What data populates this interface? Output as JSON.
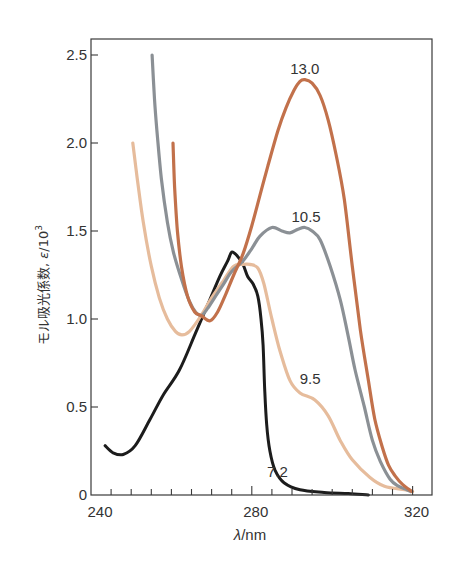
{
  "chart_data": {
    "type": "line",
    "title": "",
    "xlabel": "λ/nm",
    "ylabel": "モル吸光係数, ε/10³",
    "ylabel_parts": {
      "main": "モル吸光係数, ",
      "eps": "ε",
      "slash": "/10",
      "sup": "3"
    },
    "xlim": [
      240,
      325
    ],
    "ylim": [
      0,
      2.59
    ],
    "x_ticks": [
      240,
      280,
      320
    ],
    "x_tick_labels": [
      "240",
      "280",
      "320"
    ],
    "x_minor_step": 5,
    "y_ticks": [
      0,
      0.5,
      1.0,
      1.5,
      2.0,
      2.5
    ],
    "y_tick_labels": [
      "0",
      "0.5",
      "1.0",
      "1.5",
      "2.0",
      "2.5"
    ],
    "grid": false,
    "legend": "inline labels",
    "series": [
      {
        "name": "7.2",
        "color": "#1c1c1c",
        "label_pos": [
          286.4,
          0.13
        ],
        "points": [
          [
            243.5,
            0.28
          ],
          [
            245.5,
            0.24
          ],
          [
            248,
            0.23
          ],
          [
            251,
            0.28
          ],
          [
            254.7,
            0.43
          ],
          [
            258,
            0.57
          ],
          [
            262,
            0.71
          ],
          [
            266,
            0.92
          ],
          [
            269,
            1.08
          ],
          [
            272,
            1.24
          ],
          [
            274,
            1.33
          ],
          [
            275,
            1.38
          ],
          [
            276.3,
            1.36
          ],
          [
            277.8,
            1.31
          ],
          [
            279,
            1.24
          ],
          [
            280.3,
            1.2
          ],
          [
            281.5,
            1.13
          ],
          [
            282.3,
            1.0
          ],
          [
            282.8,
            0.85
          ],
          [
            283.2,
            0.6
          ],
          [
            283.7,
            0.4
          ],
          [
            284.5,
            0.25
          ],
          [
            285.8,
            0.14
          ],
          [
            288,
            0.07
          ],
          [
            292,
            0.03
          ],
          [
            298,
            0.015
          ],
          [
            304,
            0.008
          ],
          [
            309,
            0.0
          ]
        ]
      },
      {
        "name": "9.5",
        "color": "#e6bc9c",
        "label_pos": [
          294.5,
          0.66
        ],
        "points": [
          [
            250.4,
            2.0
          ],
          [
            251.5,
            1.8
          ],
          [
            253,
            1.55
          ],
          [
            255,
            1.3
          ],
          [
            257,
            1.12
          ],
          [
            259,
            1.0
          ],
          [
            261,
            0.93
          ],
          [
            262.6,
            0.91
          ],
          [
            264.5,
            0.93
          ],
          [
            267.4,
            1.02
          ],
          [
            270,
            1.12
          ],
          [
            273,
            1.22
          ],
          [
            275.5,
            1.3
          ],
          [
            277.8,
            1.31
          ],
          [
            279.5,
            1.31
          ],
          [
            281.5,
            1.29
          ],
          [
            283,
            1.2
          ],
          [
            285,
            1.0
          ],
          [
            287,
            0.82
          ],
          [
            289.5,
            0.65
          ],
          [
            292,
            0.58
          ],
          [
            295.7,
            0.54
          ],
          [
            299,
            0.45
          ],
          [
            302,
            0.31
          ],
          [
            305,
            0.2
          ],
          [
            309.4,
            0.1
          ],
          [
            313,
            0.05
          ],
          [
            318,
            0.03
          ],
          [
            320,
            0.02
          ]
        ]
      },
      {
        "name": "10.5",
        "color": "#8b9095",
        "label_pos": [
          293.5,
          1.58
        ],
        "points": [
          [
            255.2,
            2.5
          ],
          [
            255.8,
            2.25
          ],
          [
            256.4,
            2.07
          ],
          [
            257.5,
            1.8
          ],
          [
            259,
            1.55
          ],
          [
            260.5,
            1.38
          ],
          [
            262.6,
            1.22
          ],
          [
            264.5,
            1.1
          ],
          [
            266,
            1.04
          ],
          [
            267.4,
            1.02
          ],
          [
            269,
            1.06
          ],
          [
            271,
            1.13
          ],
          [
            273,
            1.2
          ],
          [
            275,
            1.27
          ],
          [
            277.8,
            1.33
          ],
          [
            280,
            1.4
          ],
          [
            282,
            1.47
          ],
          [
            285,
            1.52
          ],
          [
            287.5,
            1.5
          ],
          [
            289.5,
            1.49
          ],
          [
            291.5,
            1.51
          ],
          [
            293.2,
            1.52
          ],
          [
            295,
            1.5
          ],
          [
            297,
            1.45
          ],
          [
            299.5,
            1.3
          ],
          [
            302,
            1.11
          ],
          [
            304,
            0.9
          ],
          [
            305.7,
            0.71
          ],
          [
            308,
            0.5
          ],
          [
            310,
            0.31
          ],
          [
            312,
            0.19
          ],
          [
            314.4,
            0.09
          ],
          [
            316.5,
            0.05
          ],
          [
            318.6,
            0.03
          ],
          [
            319.5,
            0.02
          ]
        ]
      },
      {
        "name": "13.0",
        "color": "#c2714b",
        "label_pos": [
          293.2,
          2.42
        ],
        "points": [
          [
            260.4,
            2.0
          ],
          [
            260.8,
            1.75
          ],
          [
            261.5,
            1.5
          ],
          [
            262.5,
            1.3
          ],
          [
            264,
            1.13
          ],
          [
            265.8,
            1.04
          ],
          [
            267.4,
            1.02
          ],
          [
            269.6,
            0.99
          ],
          [
            271.5,
            1.04
          ],
          [
            273.5,
            1.14
          ],
          [
            275.5,
            1.25
          ],
          [
            277.8,
            1.37
          ],
          [
            280,
            1.53
          ],
          [
            282,
            1.7
          ],
          [
            284,
            1.87
          ],
          [
            286.5,
            2.07
          ],
          [
            288.5,
            2.2
          ],
          [
            290.5,
            2.3
          ],
          [
            292,
            2.35
          ],
          [
            293.2,
            2.36
          ],
          [
            295,
            2.34
          ],
          [
            297,
            2.27
          ],
          [
            299,
            2.13
          ],
          [
            301,
            1.93
          ],
          [
            303,
            1.68
          ],
          [
            305,
            1.3
          ],
          [
            307,
            0.94
          ],
          [
            309,
            0.65
          ],
          [
            310.6,
            0.43
          ],
          [
            312.5,
            0.27
          ],
          [
            314,
            0.17
          ],
          [
            315.6,
            0.11
          ],
          [
            317.5,
            0.06
          ],
          [
            319.8,
            0.02
          ]
        ]
      }
    ]
  },
  "layout": {
    "plot": {
      "left": 91,
      "top": 39,
      "right": 432,
      "bottom": 495
    },
    "x_px_per_unit": 4.02,
    "y_px_per_unit": 176
  }
}
